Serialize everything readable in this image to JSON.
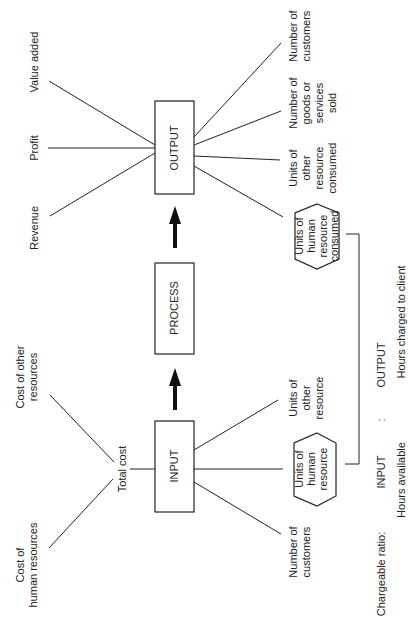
{
  "diagram": {
    "orientation": "rotated-90-ccw",
    "boxes": {
      "input": "INPUT",
      "process": "PROCESS",
      "output": "OUTPUT"
    },
    "input_side": {
      "total_cost": "Total cost",
      "cost_of_human_resources": [
        "Cost of",
        "human resources"
      ],
      "cost_of_other_resources": [
        "Cost of other",
        "resources"
      ],
      "number_of_customers": [
        "Number of",
        "customers"
      ],
      "units_of_human_resource": [
        "Units of",
        "human",
        "resource"
      ],
      "units_of_other_resource": [
        "Units of",
        "other",
        "resource"
      ]
    },
    "output_side": {
      "revenue": "Revenue",
      "profit": "Profit",
      "value_added": "Value added",
      "units_of_human_resource_consumed": [
        "Units of",
        "human",
        "resource",
        "consumed"
      ],
      "units_of_other_resource_consumed": [
        "Units of",
        "other",
        "resource",
        "consumed"
      ],
      "number_of_goods_or_services_sold": [
        "Number of",
        "goods or",
        "services",
        "sold"
      ],
      "number_of_customers": [
        "Number of",
        "customers"
      ]
    },
    "chargeable_ratio": {
      "label": "Chargeable ratio:",
      "input_label": "INPUT",
      "separator": ":",
      "output_label": "OUTPUT",
      "input_value": "Hours available",
      "output_value": "Hours charged to client"
    }
  }
}
